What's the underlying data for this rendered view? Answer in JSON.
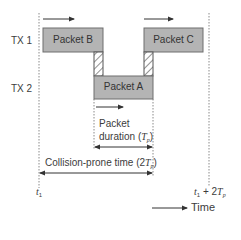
{
  "diagram": {
    "type": "timing-diagram",
    "rows": [
      {
        "label": "TX 1"
      },
      {
        "label": "TX 2"
      }
    ],
    "packets": [
      {
        "label": "Packet B",
        "row": "TX 1"
      },
      {
        "label": "Packet C",
        "row": "TX 1"
      },
      {
        "label": "Packet A",
        "row": "TX 2"
      }
    ],
    "annotations": {
      "packet_duration_line1": "Packet",
      "packet_duration_line2_prefix": "duration (",
      "packet_duration_symbol": "T",
      "packet_duration_sub": "p",
      "packet_duration_suffix": ")",
      "collision_prefix": "Collision-prone time (2",
      "collision_symbol": "T",
      "collision_sub": "p",
      "collision_suffix": ")"
    },
    "time_marks": {
      "start_symbol": "t",
      "start_sub": "1",
      "end_symbol": "t",
      "end_sub": "1",
      "end_plus": " + 2",
      "end_T": "T",
      "end_T_sub": "p"
    },
    "time_axis_label": "Time",
    "colors": {
      "packet_fill": "#b4b4b4",
      "packet_border": "#6e6e6e",
      "line": "#555555",
      "dotted": "#8a8a8a"
    }
  }
}
